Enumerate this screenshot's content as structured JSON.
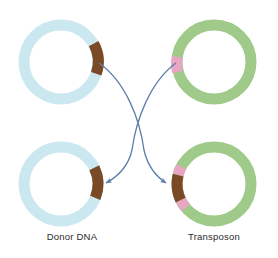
{
  "figure": {
    "background_color": "#ffffff",
    "width": 278,
    "height": 258
  },
  "palette": {
    "donor_blue": "#cbe8f0",
    "donor_blue_light": "#d9eff5",
    "transposon_green": "#a0ca89",
    "transposon_green_light": "#b2d49d",
    "brown": "#7a4a26",
    "pink": "#e7a6c2",
    "arrow_blue": "#5b7fa8",
    "label_text": "#2b2b2b"
  },
  "plasmids": [
    {
      "id": "donor-dna-before",
      "name": "donor-dna-plasmid-top",
      "position": "top-left",
      "cx": 61,
      "cy": 62,
      "radius": 37,
      "thickness": 11,
      "backbone_color": "#cbe8f0",
      "label": "",
      "segments": [
        {
          "name": "insertion-site",
          "color": "#7a4a26",
          "start_deg": -28,
          "end_deg": 18
        }
      ]
    },
    {
      "id": "transposon-before",
      "name": "transposon-plasmid-top",
      "position": "top-right",
      "cx": 214,
      "cy": 62,
      "radius": 37,
      "thickness": 11,
      "backbone_color": "#a0ca89",
      "label": "",
      "segments": [
        {
          "name": "transposon-element",
          "color": "#e7a6c2",
          "start_deg": 172,
          "end_deg": 196
        }
      ]
    },
    {
      "id": "donor-dna-after",
      "name": "donor-dna-plasmid-bottom",
      "position": "bottom-left",
      "cx": 61,
      "cy": 184,
      "radius": 37,
      "thickness": 11,
      "backbone_color": "#cbe8f0",
      "label": "Donor DNA",
      "label_x": 72,
      "label_y": 240,
      "segments": [
        {
          "name": "insertion-site",
          "color": "#7a4a26",
          "start_deg": -26,
          "end_deg": 22
        }
      ]
    },
    {
      "id": "transposon-after",
      "name": "transposon-plasmid-bottom",
      "position": "bottom-right",
      "cx": 214,
      "cy": 184,
      "radius": 37,
      "thickness": 11,
      "backbone_color": "#a0ca89",
      "label": "Transposon",
      "label_x": 214,
      "label_y": 240,
      "segments": [
        {
          "name": "flanking-repeat-upper",
          "color": "#e7a6c2",
          "start_deg": 152,
          "end_deg": 166
        },
        {
          "name": "transposed-element",
          "color": "#7a4a26",
          "start_deg": 166,
          "end_deg": 206
        },
        {
          "name": "flanking-repeat-lower",
          "color": "#e7a6c2",
          "start_deg": 206,
          "end_deg": 220
        }
      ]
    }
  ],
  "arrows": [
    {
      "id": "arrow-donor-to-transposon",
      "name": "transfer-arrow-left-to-right",
      "from": "donor-dna-before",
      "to": "transposon-after",
      "path": "M 99,63 C 126,82 140,120 144,150 C 148,168 157,177 166,183",
      "color": "#5b7fa8",
      "width": 1.3,
      "head_angle_deg": 38
    },
    {
      "id": "arrow-transposon-to-donor",
      "name": "transfer-arrow-right-to-left",
      "from": "transposon-before",
      "to": "donor-dna-after",
      "path": "M 176,63 C 150,82 136,120 132,150 C 128,168 117,177 106,183",
      "color": "#5b7fa8",
      "width": 1.3,
      "head_angle_deg": 142
    }
  ],
  "labels": {
    "donor_dna": "Donor DNA",
    "transposon": "Transposon"
  }
}
